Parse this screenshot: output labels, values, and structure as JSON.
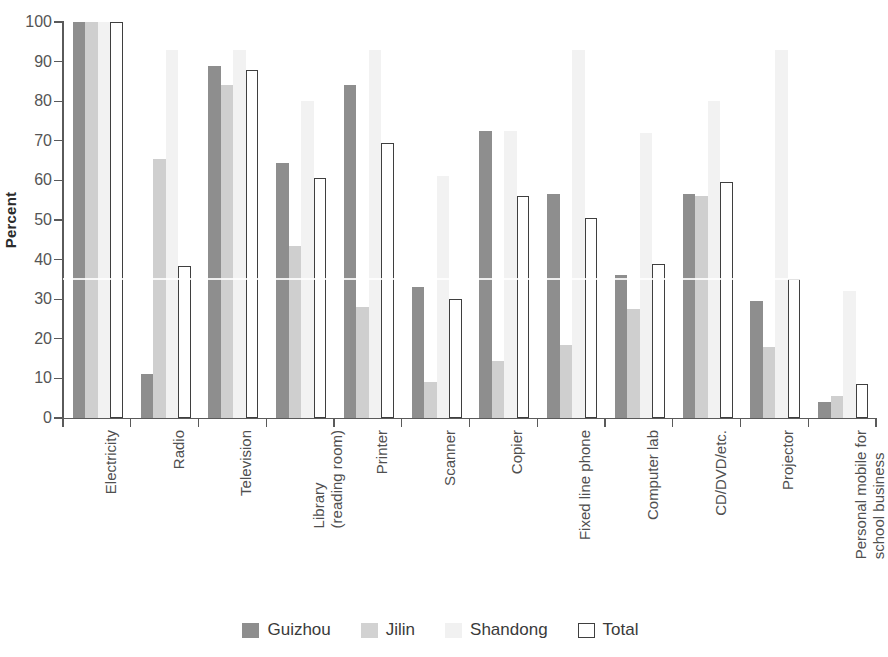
{
  "chart_data": {
    "type": "bar",
    "title": "",
    "subtitle": "",
    "xlabel": "",
    "ylabel": "Percent",
    "ylim": [
      0,
      100
    ],
    "yticks": [
      0,
      10,
      20,
      30,
      40,
      50,
      60,
      70,
      80,
      90,
      100
    ],
    "grid": false,
    "legend_position": "bottom",
    "categories": [
      "Electricity",
      "Radio",
      "Television",
      "Library\n(reading room)",
      "Printer",
      "Scanner",
      "Copier",
      "Fixed line phone",
      "Computer lab",
      "CD/DVD/etc.",
      "Projector",
      "Personal mobile for\nschool business"
    ],
    "series": [
      {
        "name": "Guizhou",
        "color": "#8e8e8e",
        "values": [
          100,
          11,
          89,
          64.5,
          84,
          33,
          72.5,
          56.5,
          36,
          56.5,
          29.5,
          4
        ]
      },
      {
        "name": "Jilin",
        "color": "#cfcfcf",
        "values": [
          100,
          65.5,
          84,
          43.5,
          28,
          9,
          14.5,
          18.5,
          27.5,
          56,
          18,
          5.5
        ]
      },
      {
        "name": "Shandong",
        "color": "#f2f2f2",
        "values": [
          100,
          93,
          93,
          80,
          93,
          61,
          72.5,
          93,
          72,
          80,
          93,
          32
        ]
      },
      {
        "name": "Total",
        "color": "#ffffff",
        "values": [
          100,
          38.5,
          88,
          60.5,
          69.5,
          30,
          56,
          50.5,
          39,
          59.5,
          35,
          8.5
        ]
      }
    ]
  },
  "axis": {
    "y_title": "Percent",
    "y_tick_labels": [
      "100",
      "90",
      "80",
      "70",
      "60",
      "50",
      "40",
      "30",
      "20",
      "10",
      "0"
    ]
  },
  "category_labels": [
    {
      "line1": "Electricity",
      "line2": ""
    },
    {
      "line1": "Radio",
      "line2": ""
    },
    {
      "line1": "Television",
      "line2": ""
    },
    {
      "line1": "Library",
      "line2": "(reading room)"
    },
    {
      "line1": "Printer",
      "line2": ""
    },
    {
      "line1": "Scanner",
      "line2": ""
    },
    {
      "line1": "Copier",
      "line2": ""
    },
    {
      "line1": "Fixed line phone",
      "line2": ""
    },
    {
      "line1": "Computer lab",
      "line2": ""
    },
    {
      "line1": "CD/DVD/etc.",
      "line2": ""
    },
    {
      "line1": "Projector",
      "line2": ""
    },
    {
      "line1": "Personal mobile for",
      "line2": "school business"
    }
  ],
  "legend": {
    "items": [
      {
        "label": "Guizhou",
        "swatch": "s-guizhou"
      },
      {
        "label": "Jilin",
        "swatch": "s-jilin"
      },
      {
        "label": "Shandong",
        "swatch": "s-shandong"
      },
      {
        "label": "Total",
        "swatch": "s-total"
      }
    ]
  }
}
